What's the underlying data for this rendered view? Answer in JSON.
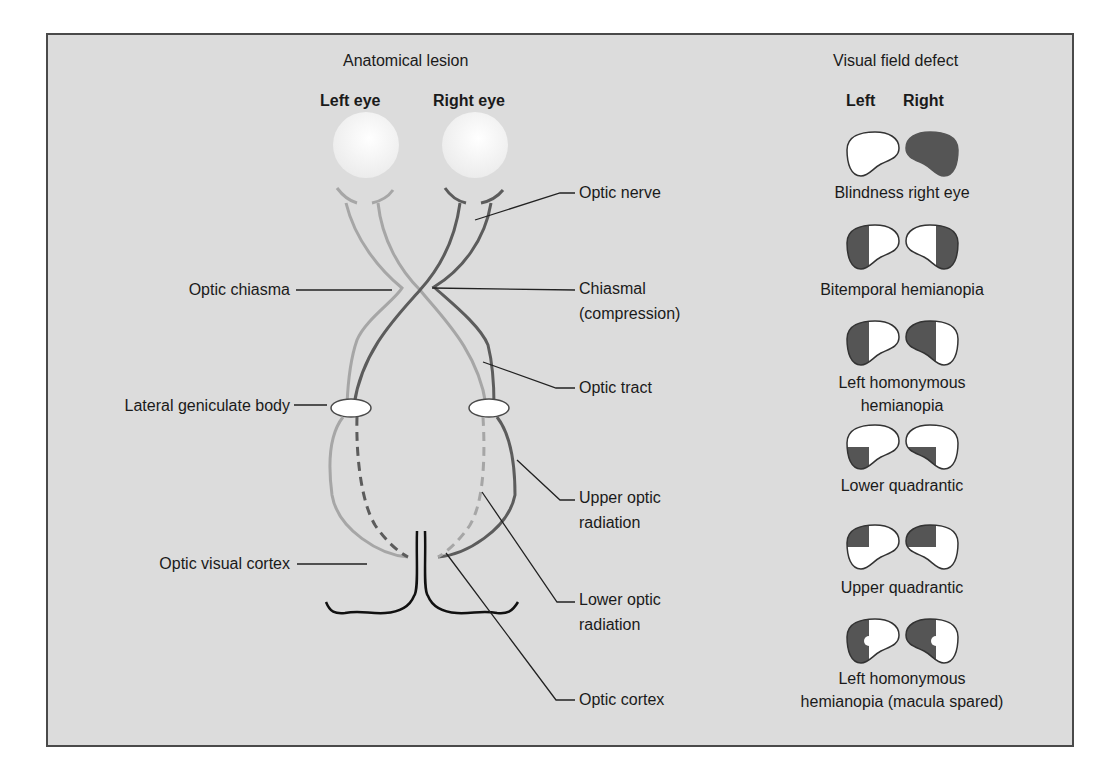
{
  "anatomy": {
    "heading": "Anatomical lesion",
    "left_eye": "Left eye",
    "right_eye": "Right eye",
    "left_labels": {
      "optic_chiasma": "Optic chiasma",
      "lateral_geniculate_body": "Lateral geniculate body",
      "optic_visual_cortex": "Optic visual cortex"
    },
    "right_labels": {
      "optic_nerve": "Optic nerve",
      "chiasmal_line1": "Chiasmal",
      "chiasmal_line2": "(compression)",
      "optic_tract": "Optic tract",
      "upper_radiation_line1": "Upper optic",
      "upper_radiation_line2": "radiation",
      "lower_radiation_line1": "Lower optic",
      "lower_radiation_line2": "radiation",
      "optic_cortex": "Optic cortex"
    }
  },
  "visual_field": {
    "heading": "Visual field defect",
    "col_left": "Left",
    "col_right": "Right",
    "defects": [
      {
        "label_line1": "Blindness right eye",
        "label_line2": ""
      },
      {
        "label_line1": "Bitemporal hemianopia",
        "label_line2": ""
      },
      {
        "label_line1": "Left homonymous",
        "label_line2": "hemianopia"
      },
      {
        "label_line1": "Lower quadrantic",
        "label_line2": ""
      },
      {
        "label_line1": "Upper quadrantic",
        "label_line2": ""
      },
      {
        "label_line1": "Left homonymous",
        "label_line2": "hemianopia (macula spared)"
      }
    ]
  },
  "colors": {
    "background": "#dcdcdc",
    "defect_fill": "#555555",
    "field_fill": "#ffffff",
    "nerve_dark": "#5c5c5c",
    "nerve_light": "#a6a6a6"
  }
}
